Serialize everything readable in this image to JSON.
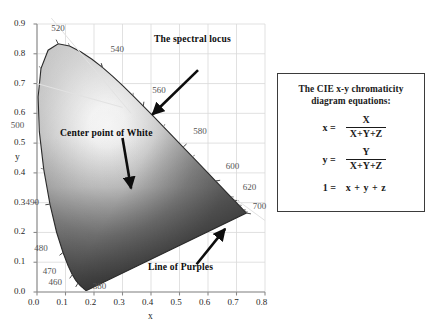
{
  "chart_data": {
    "type": "scatter",
    "title": "",
    "xlabel": "x",
    "ylabel": "y",
    "xlim": [
      0.0,
      0.8
    ],
    "ylim": [
      0.0,
      0.9
    ],
    "grid": true,
    "legend_position": "none",
    "x_ticks": [
      "0.0",
      "0.1",
      "0.2",
      "0.3",
      "0.4",
      "0.5",
      "0.6",
      "0.7",
      "0.8"
    ],
    "x_tick_values": [
      0.0,
      0.1,
      0.2,
      0.3,
      0.4,
      0.5,
      0.6,
      0.7,
      0.8
    ],
    "y_ticks": [
      "0.0",
      "0.1",
      "0.2",
      "0.3",
      "0.4",
      "0.5",
      "0.6",
      "0.7",
      "0.8",
      "0.9"
    ],
    "y_tick_values": [
      0.0,
      0.1,
      0.2,
      0.3,
      0.4,
      0.5,
      0.6,
      0.7,
      0.8,
      0.9
    ],
    "wavelength_labels": [
      {
        "nm": "520",
        "x": 0.074,
        "y": 0.834,
        "label_x": 0.05,
        "label_y": 0.884,
        "anchor": "start"
      },
      {
        "nm": "540",
        "x": 0.229,
        "y": 0.754,
        "label_x": 0.258,
        "label_y": 0.812,
        "anchor": "start"
      },
      {
        "nm": "560",
        "x": 0.373,
        "y": 0.624,
        "label_x": 0.404,
        "label_y": 0.676,
        "anchor": "start"
      },
      {
        "nm": "580",
        "x": 0.513,
        "y": 0.487,
        "label_x": 0.548,
        "label_y": 0.536,
        "anchor": "start"
      },
      {
        "nm": "600",
        "x": 0.627,
        "y": 0.373,
        "label_x": 0.662,
        "label_y": 0.421,
        "anchor": "start"
      },
      {
        "nm": "620",
        "x": 0.691,
        "y": 0.308,
        "label_x": 0.722,
        "label_y": 0.349,
        "anchor": "start"
      },
      {
        "nm": "700",
        "x": 0.735,
        "y": 0.265,
        "label_x": 0.757,
        "label_y": 0.286,
        "anchor": "start"
      },
      {
        "nm": "500",
        "x": 0.008,
        "y": 0.538,
        "label_x": -0.092,
        "label_y": 0.556,
        "anchor": "start"
      },
      {
        "nm": "490",
        "x": 0.045,
        "y": 0.295,
        "label_x": -0.04,
        "label_y": 0.3,
        "anchor": "start"
      },
      {
        "nm": "480",
        "x": 0.091,
        "y": 0.133,
        "label_x": -0.01,
        "label_y": 0.144,
        "anchor": "start"
      },
      {
        "nm": "470",
        "x": 0.124,
        "y": 0.058,
        "label_x": 0.02,
        "label_y": 0.066,
        "anchor": "start"
      },
      {
        "nm": "460",
        "x": 0.144,
        "y": 0.03,
        "label_x": 0.04,
        "label_y": 0.03,
        "anchor": "start"
      },
      {
        "nm": "380",
        "x": 0.174,
        "y": 0.005,
        "label_x": 0.196,
        "label_y": 0.018,
        "anchor": "start"
      }
    ],
    "white_point": {
      "x": 0.333,
      "y": 0.333,
      "label": "Center point of White"
    },
    "spectral_locus_points": [
      [
        0.1741,
        0.005
      ],
      [
        0.174,
        0.005
      ],
      [
        0.1738,
        0.0049
      ],
      [
        0.1736,
        0.0049
      ],
      [
        0.1733,
        0.0048
      ],
      [
        0.173,
        0.0048
      ],
      [
        0.1726,
        0.0048
      ],
      [
        0.1721,
        0.0048
      ],
      [
        0.1714,
        0.0051
      ],
      [
        0.1703,
        0.0058
      ],
      [
        0.1689,
        0.0069
      ],
      [
        0.1669,
        0.0086
      ],
      [
        0.1644,
        0.0109
      ],
      [
        0.1611,
        0.0138
      ],
      [
        0.1566,
        0.0177
      ],
      [
        0.151,
        0.0227
      ],
      [
        0.144,
        0.0297
      ],
      [
        0.1355,
        0.0399
      ],
      [
        0.1241,
        0.0578
      ],
      [
        0.1096,
        0.0868
      ],
      [
        0.0913,
        0.1327
      ],
      [
        0.0687,
        0.2007
      ],
      [
        0.0454,
        0.295
      ],
      [
        0.0235,
        0.4127
      ],
      [
        0.0082,
        0.5384
      ],
      [
        0.0039,
        0.6548
      ],
      [
        0.0139,
        0.7502
      ],
      [
        0.0389,
        0.812
      ],
      [
        0.0743,
        0.8338
      ],
      [
        0.1142,
        0.8262
      ],
      [
        0.1547,
        0.8059
      ],
      [
        0.1929,
        0.7816
      ],
      [
        0.2296,
        0.7543
      ],
      [
        0.2658,
        0.7243
      ],
      [
        0.3016,
        0.6923
      ],
      [
        0.3373,
        0.6589
      ],
      [
        0.3731,
        0.6245
      ],
      [
        0.4087,
        0.5896
      ],
      [
        0.4441,
        0.5547
      ],
      [
        0.4788,
        0.5202
      ],
      [
        0.5125,
        0.4866
      ],
      [
        0.5448,
        0.4544
      ],
      [
        0.5752,
        0.4242
      ],
      [
        0.6029,
        0.3965
      ],
      [
        0.627,
        0.3725
      ],
      [
        0.6482,
        0.3514
      ],
      [
        0.6658,
        0.334
      ],
      [
        0.6801,
        0.3197
      ],
      [
        0.6915,
        0.3083
      ],
      [
        0.7006,
        0.2993
      ],
      [
        0.7079,
        0.292
      ],
      [
        0.714,
        0.2859
      ],
      [
        0.719,
        0.2809
      ],
      [
        0.723,
        0.277
      ],
      [
        0.726,
        0.274
      ],
      [
        0.7283,
        0.2717
      ],
      [
        0.73,
        0.27
      ],
      [
        0.7311,
        0.2689
      ],
      [
        0.732,
        0.268
      ],
      [
        0.7327,
        0.2673
      ],
      [
        0.7334,
        0.2666
      ],
      [
        0.734,
        0.266
      ],
      [
        0.7344,
        0.2656
      ],
      [
        0.7346,
        0.2654
      ],
      [
        0.7347,
        0.2653
      ]
    ]
  },
  "axes": {
    "x_label": "x",
    "y_label": "y"
  },
  "annotations": {
    "spectral_locus": "The spectral locus",
    "center_white": "Center point of White",
    "line_of_purples": "Line of Purples"
  },
  "equation_box": {
    "title_line1": "The CIE x-y chromaticity",
    "title_line2": "diagram equations:",
    "rows": [
      {
        "lhs": "x =",
        "numerator": "X",
        "denominator": "X+Y+Z"
      },
      {
        "lhs": "y =",
        "numerator": "Y",
        "denominator": "X+Y+Z"
      }
    ],
    "identity_lhs": "1 =",
    "identity_rhs": "x + y + z"
  },
  "colors": {
    "grid": "#d9d9d9",
    "axis": "#8a8a8a",
    "locus_line": "#2b2b2b",
    "text": "#111111",
    "wavelength_text": "#555555",
    "box_border": "#3b3b3b",
    "background": "#ffffff"
  }
}
